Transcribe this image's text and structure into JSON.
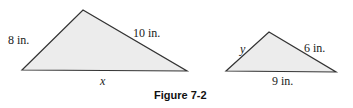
{
  "figure": {
    "caption": "Figure 7-2",
    "fill_color": "#ececec",
    "stroke_color": "#333333"
  },
  "triangles": [
    {
      "name": "large-triangle",
      "sides": {
        "left": "8 in.",
        "right": "10 in.",
        "base": "x"
      }
    },
    {
      "name": "small-triangle",
      "sides": {
        "left": "y",
        "right": "6 in.",
        "base": "9 in."
      }
    }
  ]
}
